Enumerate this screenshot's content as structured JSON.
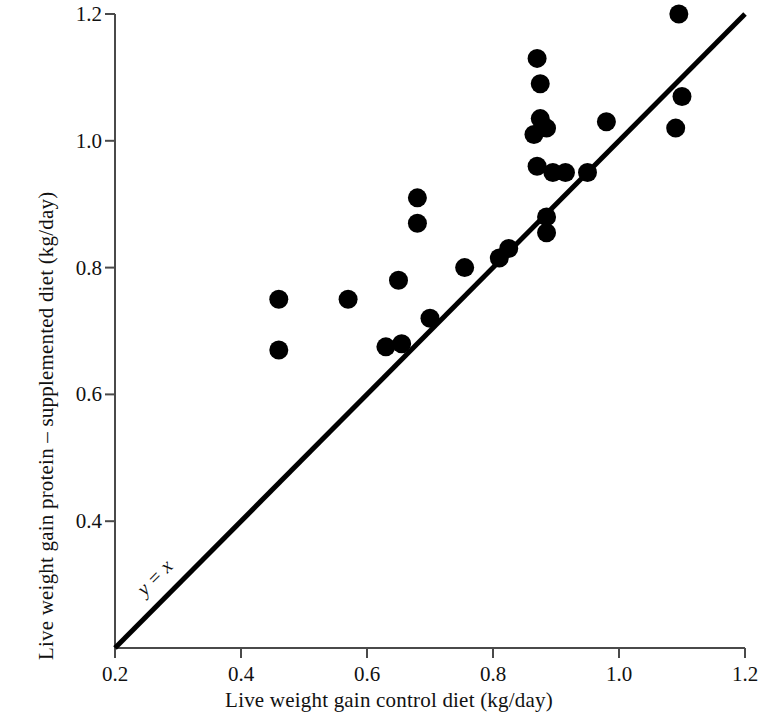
{
  "chart_data": {
    "type": "scatter",
    "title": "",
    "xlabel": "Live weight gain control diet (kg/day)",
    "ylabel": "Live weight gain protein – supplemented diet (kg/day)",
    "xlim": [
      0.2,
      1.2
    ],
    "ylim": [
      0.2,
      1.2
    ],
    "xticks": [
      "0.2",
      "0.4",
      "0.6",
      "0.8",
      "1.0",
      "1.2"
    ],
    "yticks": [
      "0.4",
      "0.6",
      "0.8",
      "1.0",
      "1.2"
    ],
    "xtick_values": [
      0.2,
      0.4,
      0.6,
      0.8,
      1.0,
      1.2
    ],
    "ytick_values": [
      0.4,
      0.6,
      0.8,
      1.0,
      1.2
    ],
    "grid": false,
    "legend": null,
    "marker": "filled-circle",
    "marker_color": "#000000",
    "annotations": [
      {
        "text": "y = x",
        "x": 0.27,
        "y": 0.3,
        "style": "italic",
        "rotation": -45,
        "describes": "identity-line"
      }
    ],
    "reference_line": {
      "name": "identity-line",
      "equation": "y = x",
      "from": [
        0.2,
        0.2
      ],
      "to": [
        1.2,
        1.2
      ],
      "color": "#000000"
    },
    "points": [
      {
        "x": 0.46,
        "y": 0.75
      },
      {
        "x": 0.46,
        "y": 0.67
      },
      {
        "x": 0.57,
        "y": 0.75
      },
      {
        "x": 0.63,
        "y": 0.675
      },
      {
        "x": 0.655,
        "y": 0.68
      },
      {
        "x": 0.65,
        "y": 0.78
      },
      {
        "x": 0.68,
        "y": 0.91
      },
      {
        "x": 0.68,
        "y": 0.87
      },
      {
        "x": 0.7,
        "y": 0.72
      },
      {
        "x": 0.755,
        "y": 0.8
      },
      {
        "x": 0.81,
        "y": 0.815
      },
      {
        "x": 0.825,
        "y": 0.83
      },
      {
        "x": 0.87,
        "y": 1.13
      },
      {
        "x": 0.875,
        "y": 1.09
      },
      {
        "x": 0.875,
        "y": 1.035
      },
      {
        "x": 0.885,
        "y": 1.02
      },
      {
        "x": 0.865,
        "y": 1.01
      },
      {
        "x": 0.87,
        "y": 0.96
      },
      {
        "x": 0.895,
        "y": 0.95
      },
      {
        "x": 0.915,
        "y": 0.95
      },
      {
        "x": 0.885,
        "y": 0.88
      },
      {
        "x": 0.885,
        "y": 0.855
      },
      {
        "x": 0.95,
        "y": 0.95
      },
      {
        "x": 0.98,
        "y": 1.03
      },
      {
        "x": 1.095,
        "y": 1.2
      },
      {
        "x": 1.1,
        "y": 1.07
      },
      {
        "x": 1.09,
        "y": 1.02
      }
    ],
    "point_count": 27
  },
  "axes": {
    "x_title": "Live weight gain control diet (kg/day)",
    "y_title": "Live weight gain protein – supplemented diet (kg/day)"
  },
  "ticks": {
    "x": [
      "0.2",
      "0.4",
      "0.6",
      "0.8",
      "1.0",
      "1.2"
    ],
    "y": [
      "0.4",
      "0.6",
      "0.8",
      "1.0",
      "1.2"
    ]
  },
  "annotation": {
    "identity_label": "y = x"
  }
}
